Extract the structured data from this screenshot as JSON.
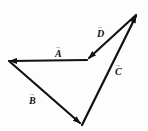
{
  "diagram": {
    "type": "vector-diagram",
    "vectors": [
      {
        "id": "A",
        "label": "A",
        "arrow": "→",
        "from": [
          87,
          60
        ],
        "to": [
          9,
          61
        ],
        "label_pos": [
          55,
          55
        ]
      },
      {
        "id": "B",
        "label": "B",
        "arrow": "→",
        "from": [
          9,
          61
        ],
        "to": [
          81,
          124
        ],
        "label_pos": [
          29,
          103
        ]
      },
      {
        "id": "C",
        "label": "C",
        "arrow": "→",
        "from": [
          82,
          125
        ],
        "to": [
          137,
          14
        ],
        "label_pos": [
          116,
          74
        ]
      },
      {
        "id": "D",
        "label": "D",
        "arrow": "→",
        "from": [
          136,
          15
        ],
        "to": [
          88,
          59
        ],
        "label_pos": [
          97,
          36
        ]
      }
    ],
    "stroke_color": "#111111",
    "background": "#ffffff"
  }
}
